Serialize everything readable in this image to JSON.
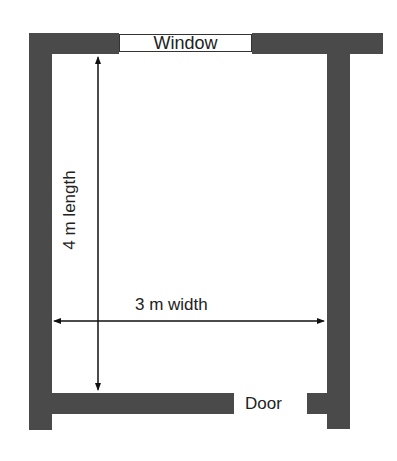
{
  "diagram": {
    "window_label": "Window",
    "door_label": "Door",
    "length_label": "4 m length",
    "width_label": "3 m width",
    "wall_color": "#4a4a4a"
  }
}
